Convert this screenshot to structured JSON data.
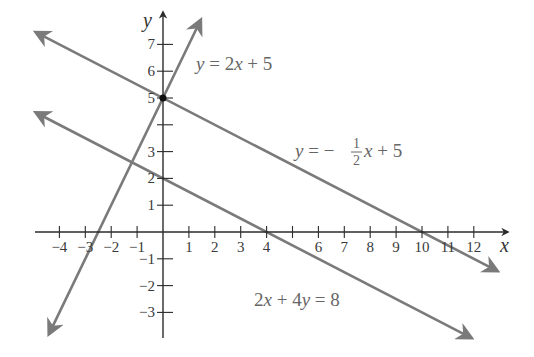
{
  "chart_data": {
    "type": "line",
    "title": "",
    "xlabel": "x",
    "ylabel": "y",
    "xlim": [
      -4.9,
      13.2
    ],
    "ylim": [
      -3.9,
      8.0
    ],
    "grid": false,
    "x_ticks": [
      -4,
      -3,
      -2,
      -1,
      1,
      2,
      3,
      4,
      6,
      7,
      8,
      9,
      10,
      11,
      12
    ],
    "x_tick_labels": [
      "−4",
      "−3",
      "−2",
      "−1",
      "1",
      "2",
      "3",
      "4",
      "6",
      "7",
      "8",
      "9",
      "10",
      "11",
      "12"
    ],
    "x_tick_marks": [
      -4,
      -3,
      -2,
      -1,
      1,
      2,
      3,
      4,
      5,
      6,
      7,
      8,
      9,
      10,
      11,
      12
    ],
    "y_ticks": [
      -3,
      -2,
      -1,
      1,
      2,
      3,
      5,
      6,
      7
    ],
    "y_tick_labels": [
      "−3",
      "−2",
      "−1",
      "1",
      "2",
      "3",
      "5",
      "6",
      "7"
    ],
    "y_tick_marks": [
      -3,
      -2,
      -1,
      1,
      2,
      3,
      4,
      5,
      6,
      7
    ],
    "series": [
      {
        "name": "y = 2x + 5",
        "slope": 2,
        "intercept": 5,
        "x": [
          -4.4,
          1.45
        ],
        "y": [
          -3.8,
          7.9
        ]
      },
      {
        "name": "y = -1/2 x + 5",
        "slope": -0.5,
        "intercept": 5,
        "x": [
          -4.9,
          12.9
        ],
        "y": [
          7.45,
          -1.45
        ]
      },
      {
        "name": "2x + 4y = 8",
        "slope": -0.5,
        "intercept": 2,
        "x": [
          -4.9,
          11.9
        ],
        "y": [
          4.45,
          -3.95
        ]
      }
    ],
    "points": [
      {
        "x": 0,
        "y": 5,
        "label": "intersection"
      }
    ],
    "annotations": [
      {
        "text": "y = 2x + 5",
        "x": 1.3,
        "y": 6.3
      },
      {
        "text": "y = −½x + 5",
        "x": 5.1,
        "y": 3.0
      },
      {
        "text": "2x + 4y = 8",
        "x": 3.2,
        "y": -1.9
      }
    ]
  },
  "labels": {
    "x_axis": "x",
    "y_axis": "y",
    "eq1": {
      "lhs": "y",
      "rel": " = ",
      "rhs_a": "2",
      "rhs_var": "x",
      "rhs_b": " + 5"
    },
    "eq2": {
      "lhs": "y",
      "rel": " = −",
      "num": "1",
      "den": "2",
      "var": "x",
      "rhs_b": " + 5"
    },
    "eq3": {
      "a": "2",
      "v1": "x",
      "mid": " + 4",
      "v2": "y",
      "rhs": " = 8"
    }
  },
  "colors": {
    "axis": "#2b2b2b",
    "line": "#7a7a7a",
    "point": "#111111",
    "text": "#666666"
  }
}
